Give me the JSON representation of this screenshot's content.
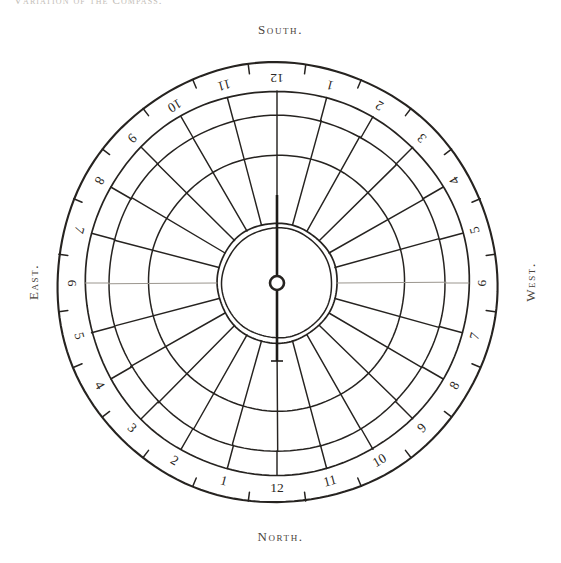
{
  "page": {
    "running_header": "Variation of the Compass.",
    "background_color": "#ffffff",
    "ink_color": "#262320"
  },
  "cardinals": {
    "top": "South.",
    "bottom": "North.",
    "left": "East.",
    "right": "West."
  },
  "dial": {
    "center_x": 277,
    "center_y": 283,
    "outer_radius": 220,
    "numeral_ring_inner_radius": 192,
    "arc_outer_radius": 168,
    "arc_middle_radius": 128,
    "inner_circle_radius": 60,
    "inner_circle_inner_radius": 55,
    "divisions": 24,
    "numerals_rotated_180": true,
    "numeral_ring_labels": [
      "12",
      "1",
      "2",
      "3",
      "4",
      "5",
      "6",
      "7",
      "8",
      "9",
      "10",
      "11",
      "12",
      "1",
      "2",
      "3",
      "4",
      "5",
      "6",
      "7",
      "8",
      "9",
      "10",
      "11"
    ],
    "tick_count": 24
  },
  "needle": {
    "name": "compass-needle",
    "points_to": "South.",
    "heading_degrees": 0,
    "pivot_radius": 7,
    "north_arm_length": 88,
    "south_arm_length": 78,
    "has_tail_crossbar": true
  },
  "chart_data": {
    "type": "pie",
    "title": "Variation of the Compass.",
    "subtitle": "",
    "xlabel": "",
    "ylabel": "",
    "legend_position": "none",
    "grid": true,
    "categories": [
      "12",
      "1",
      "2",
      "3",
      "4",
      "5",
      "6",
      "7",
      "8",
      "9",
      "10",
      "11",
      "12",
      "1",
      "2",
      "3",
      "4",
      "5",
      "6",
      "7",
      "8",
      "9",
      "10",
      "11"
    ],
    "values": [
      15,
      15,
      15,
      15,
      15,
      15,
      15,
      15,
      15,
      15,
      15,
      15,
      15,
      15,
      15,
      15,
      15,
      15,
      15,
      15,
      15,
      15,
      15,
      15
    ],
    "series": [
      {
        "name": "sector angular width (degrees)",
        "values": [
          15,
          15,
          15,
          15,
          15,
          15,
          15,
          15,
          15,
          15,
          15,
          15,
          15,
          15,
          15,
          15,
          15,
          15,
          15,
          15,
          15,
          15,
          15,
          15
        ]
      }
    ],
    "rings": [
      {
        "name": "outer rim",
        "radius": 220
      },
      {
        "name": "numeral ring inner edge",
        "radius": 192
      },
      {
        "name": "outer sector arc",
        "radius": 168
      },
      {
        "name": "middle sector arc",
        "radius": 128
      },
      {
        "name": "hub circle",
        "radius": 60
      }
    ],
    "axis_labels": {
      "top": "South.",
      "right": "West.",
      "bottom": "North.",
      "left": "East."
    },
    "ylim": [
      0,
      360
    ]
  }
}
